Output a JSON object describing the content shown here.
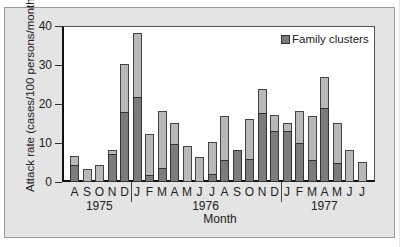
{
  "chart_data": {
    "type": "bar",
    "stacked_overlay": true,
    "title": "",
    "xlabel": "Month",
    "ylabel": "Attack rate (cases/100 persons/month)",
    "ylim": [
      0,
      40
    ],
    "yticks": [
      0,
      10,
      20,
      30,
      40
    ],
    "legend": {
      "position": "top-right",
      "entries": [
        "Family clusters"
      ]
    },
    "years": [
      {
        "label": "1975",
        "months": [
          "A",
          "S",
          "O",
          "N",
          "D"
        ]
      },
      {
        "label": "1976",
        "months": [
          "J",
          "F",
          "M",
          "A",
          "M",
          "J",
          "J",
          "A",
          "S",
          "O",
          "N",
          "D"
        ]
      },
      {
        "label": "1977",
        "months": [
          "J",
          "F",
          "M",
          "A",
          "M",
          "J",
          "J"
        ]
      }
    ],
    "categories": [
      "A",
      "S",
      "O",
      "N",
      "D",
      "J",
      "F",
      "M",
      "A",
      "M",
      "J",
      "J",
      "A",
      "S",
      "O",
      "N",
      "D",
      "J",
      "F",
      "M",
      "A",
      "M",
      "J",
      "J"
    ],
    "series": [
      {
        "name": "Total attack rate",
        "values": [
          6.7,
          3.3,
          4.4,
          8.2,
          30.3,
          38.2,
          12.3,
          18.2,
          15.1,
          9.2,
          6.4,
          10.3,
          17.0,
          8.2,
          16.2,
          23.8,
          17.2,
          15.1,
          18.2,
          16.9,
          26.9,
          15.1,
          8.2,
          5.1
        ]
      },
      {
        "name": "Family clusters",
        "values": [
          4.4,
          0,
          0,
          7.2,
          18.0,
          21.8,
          1.8,
          3.6,
          9.7,
          0,
          0,
          2.0,
          5.6,
          8.2,
          5.9,
          17.7,
          13.1,
          13.1,
          10.0,
          5.6,
          19.0,
          4.9,
          0,
          0
        ]
      }
    ],
    "grid": false,
    "colors": {
      "total": "#b8b8b8",
      "family": "#7c7c7c",
      "background": "#e4e4e4",
      "plot": "#ffffff"
    }
  },
  "labels": {
    "ylabel": "Attack rate (cases/100 persons/month)",
    "xlabel": "Month",
    "legend": "Family clusters",
    "yticks": [
      "0",
      "10",
      "20",
      "30",
      "40"
    ],
    "years": [
      "1975",
      "1976",
      "1977"
    ]
  }
}
